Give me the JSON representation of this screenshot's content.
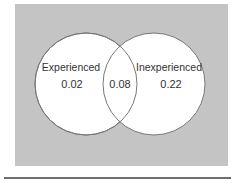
{
  "diagram": {
    "type": "venn",
    "background_color": "#c4c4c4",
    "circle_fill": "#ffffff",
    "circle_stroke": "#777777",
    "sets": [
      {
        "label": "Experienced",
        "value": "0.02"
      },
      {
        "label": "Inexperienced",
        "value": "0.22"
      }
    ],
    "intersection": {
      "value": "0.08"
    }
  }
}
